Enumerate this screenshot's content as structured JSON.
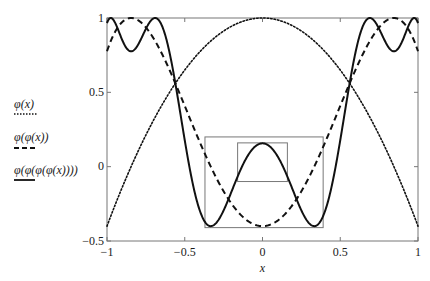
{
  "chart_data": {
    "type": "line",
    "title": "",
    "xlabel": "x",
    "ylabel": "",
    "xlim": [
      -1,
      1
    ],
    "ylim": [
      -0.5,
      1
    ],
    "grid": false,
    "legend_position": "left-outside",
    "x_ticks": [
      -1,
      -0.5,
      0,
      0.5,
      1
    ],
    "x_tick_labels": [
      "−1",
      "−0.5",
      "0",
      "0.5",
      "1"
    ],
    "y_ticks": [
      -0.5,
      0,
      0.5,
      1
    ],
    "y_tick_labels": [
      "−0.5",
      "0",
      "0.5",
      "1"
    ],
    "map_parameter_a": 1.4,
    "map_formula": "phi(x) = 1 - 1.4 x^2",
    "x": [
      -1,
      -0.9,
      -0.8,
      -0.7,
      -0.6,
      -0.5,
      -0.4,
      -0.3,
      -0.2,
      -0.1,
      0,
      0.1,
      0.2,
      0.3,
      0.4,
      0.5,
      0.6,
      0.7,
      0.8,
      0.9,
      1
    ],
    "series": [
      {
        "name": "φ(x)",
        "iterations": 1,
        "style": "dotted",
        "values": [
          -0.4,
          -0.134,
          0.104,
          0.314,
          0.496,
          0.65,
          0.776,
          0.874,
          0.944,
          0.986,
          1,
          0.986,
          0.944,
          0.874,
          0.776,
          0.65,
          0.496,
          0.314,
          0.104,
          -0.134,
          -0.4
        ]
      },
      {
        "name": "φ(φ(x))",
        "iterations": 2,
        "style": "dashed",
        "values": [
          0.776,
          0.975,
          0.985,
          0.862,
          0.656,
          0.409,
          0.157,
          -0.069,
          -0.248,
          -0.361,
          -0.4,
          -0.361,
          -0.248,
          -0.069,
          0.157,
          0.409,
          0.656,
          0.862,
          0.985,
          0.975,
          0.776
        ]
      },
      {
        "name": "φ(φ(φ(φ(x))))",
        "iterations": 4,
        "style": "solid",
        "values": [
          0.966,
          0.847,
          0.821,
          0.998,
          0.779,
          0.179,
          -0.305,
          -0.381,
          -0.17,
          0.064,
          0.157,
          0.064,
          -0.17,
          -0.381,
          -0.305,
          0.179,
          0.779,
          0.998,
          0.821,
          0.847,
          0.966
        ]
      }
    ],
    "annotations": [
      {
        "type": "rectangle",
        "label": "outer-box",
        "x": [
          -0.37,
          0.39
        ],
        "y": [
          -0.41,
          0.2
        ]
      },
      {
        "type": "rectangle",
        "label": "inner-box",
        "x": [
          -0.16,
          0.16
        ],
        "y": [
          -0.1,
          0.16
        ]
      }
    ]
  },
  "legend": [
    {
      "label": "φ(x)",
      "style": "dotted"
    },
    {
      "label": "φ(φ(x))",
      "style": "dashed"
    },
    {
      "label": "φ(φ(φ(φ(x))))",
      "style": "solid"
    }
  ],
  "colors": {
    "curve": "#111111",
    "axis": "#777777",
    "box": "#777777"
  }
}
